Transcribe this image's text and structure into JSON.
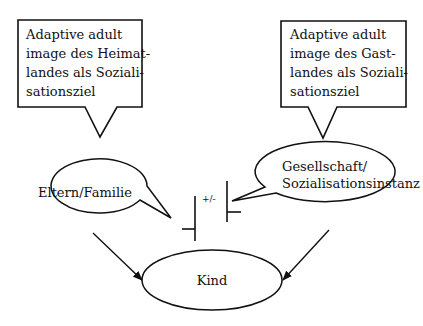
{
  "diagram": {
    "callout_left": {
      "lines": [
        "Adaptive adult",
        "image des Heimat-",
        "landes als Soziali-",
        "sationsziel"
      ]
    },
    "callout_right": {
      "lines": [
        "Adaptive adult",
        "image des Gast-",
        "landes als Soziali-",
        "sationsziel"
      ]
    },
    "node_family": {
      "label": "Eltern/Familie"
    },
    "node_society": {
      "lines": [
        "Gesellschaft/",
        "Sozialisationsinstanz"
      ]
    },
    "node_child": {
      "label": "Kind"
    },
    "relation": {
      "label": "+/-"
    }
  }
}
